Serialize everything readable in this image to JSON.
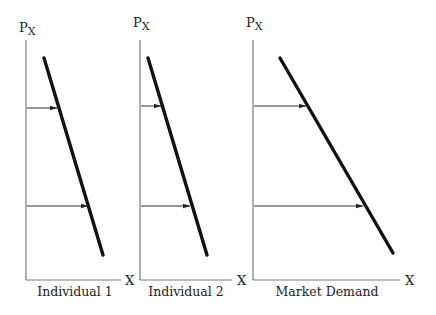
{
  "diagram": {
    "panels": [
      {
        "id": "individual-1",
        "caption": "Individual 1",
        "y_axis_label": "P",
        "y_axis_sub": "X",
        "x_axis_label": "X",
        "axis_origin": [
          26,
          280
        ],
        "y_axis_top": 40,
        "x_axis_end": 121,
        "ylabel_pos": [
          19,
          32
        ],
        "xlabel_pos": [
          125,
          285
        ],
        "caption_pos": [
          75,
          296
        ],
        "demand_line": [
          [
            44,
            58
          ],
          [
            103,
            255
          ]
        ],
        "arrows": [
          {
            "y": 108,
            "x_start": 27,
            "x_end": 57
          },
          {
            "y": 206,
            "x_start": 27,
            "x_end": 88
          }
        ]
      },
      {
        "id": "individual-2",
        "caption": "Individual 2",
        "y_axis_label": "P",
        "y_axis_sub": "X",
        "x_axis_label": "X",
        "axis_origin": [
          140,
          280
        ],
        "y_axis_top": 40,
        "x_axis_end": 232,
        "ylabel_pos": [
          133,
          27
        ],
        "xlabel_pos": [
          237,
          285
        ],
        "caption_pos": [
          186,
          296
        ],
        "demand_line": [
          [
            148,
            58
          ],
          [
            207,
            255
          ]
        ],
        "arrows": [
          {
            "y": 106,
            "x_start": 141,
            "x_end": 161
          },
          {
            "y": 206,
            "x_start": 141,
            "x_end": 190
          }
        ]
      },
      {
        "id": "market-demand",
        "caption": "Market Demand",
        "y_axis_label": "P",
        "y_axis_sub": "X",
        "x_axis_label": "X",
        "axis_origin": [
          253,
          280
        ],
        "y_axis_top": 40,
        "x_axis_end": 400,
        "ylabel_pos": [
          246,
          27
        ],
        "xlabel_pos": [
          405,
          285
        ],
        "caption_pos": [
          327,
          296
        ],
        "demand_line": [
          [
            280,
            58
          ],
          [
            393,
            253
          ]
        ],
        "arrows": [
          {
            "y": 106,
            "x_start": 254,
            "x_end": 306
          },
          {
            "y": 206,
            "x_start": 254,
            "x_end": 363
          }
        ]
      }
    ]
  },
  "colors": {
    "axis": "#7a7a7a",
    "curve": "#111111",
    "arrow": "#333333",
    "text": "#222222"
  }
}
